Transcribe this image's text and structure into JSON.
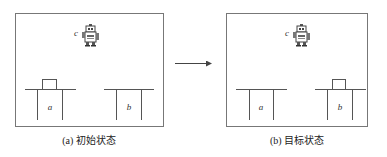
{
  "figure": {
    "arrow_color": "#444444",
    "line_color": "#555555",
    "panels": [
      {
        "id": "initial",
        "caption": "(a) 初始状态",
        "robot": {
          "label": "c"
        },
        "tables": [
          {
            "label": "a",
            "has_block": true
          },
          {
            "label": "b",
            "has_block": false
          }
        ]
      },
      {
        "id": "goal",
        "caption": "(b) 目标状态",
        "robot": {
          "label": "c"
        },
        "tables": [
          {
            "label": "a",
            "has_block": false
          },
          {
            "label": "b",
            "has_block": true
          }
        ]
      }
    ],
    "bottom_caption": ""
  }
}
